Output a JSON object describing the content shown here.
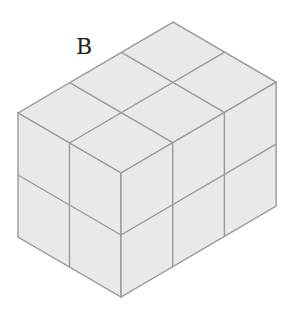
{
  "figure": {
    "label": "B",
    "dimensions": {
      "left_face_cubes": 2,
      "right_face_cubes": 3,
      "height_cubes": 2
    },
    "colors": {
      "face_fill": "#e9e9e9",
      "edge": "#9a9a9a",
      "background": "#ffffff"
    }
  }
}
